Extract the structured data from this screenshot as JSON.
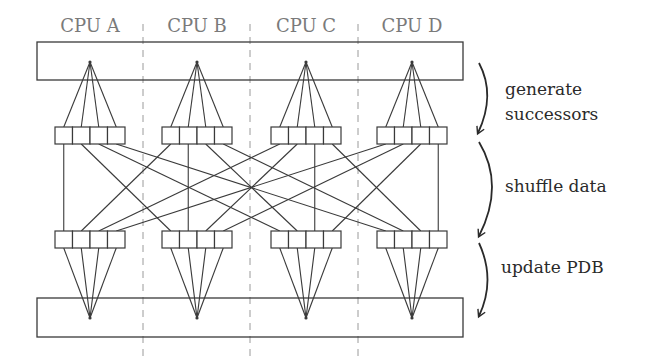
{
  "diagram": {
    "cpus": [
      {
        "label": "CPU A",
        "center_x": 90
      },
      {
        "label": "CPU B",
        "center_x": 197
      },
      {
        "label": "CPU C",
        "center_x": 306
      },
      {
        "label": "CPU D",
        "center_x": 412
      }
    ],
    "cells_per_cpu": 4,
    "phases": [
      {
        "label_lines": [
          "generate",
          "successors"
        ]
      },
      {
        "label_lines": [
          "shuffle data"
        ]
      },
      {
        "label_lines": [
          "update PDB"
        ]
      }
    ],
    "colors": {
      "line": "#3a3a3a",
      "label": "#7a7a7a",
      "phase_text": "#2a2a2a",
      "divider": "#9a9a9a"
    }
  }
}
